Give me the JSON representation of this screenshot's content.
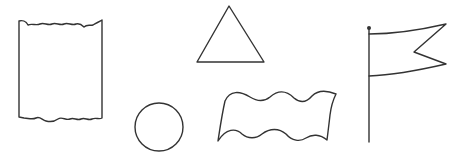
{
  "figure": {
    "title": "Shape outlines",
    "stroke_color": "#333333",
    "background": "#ffffff",
    "shapes": [
      {
        "id": "scroll-rectangle",
        "label": "Rectangle with wavy top and bottom edges"
      },
      {
        "id": "triangle",
        "label": "Triangle"
      },
      {
        "id": "circle",
        "label": "Circle"
      },
      {
        "id": "wavy-banner",
        "label": "Wavy banner"
      },
      {
        "id": "pennant-flag",
        "label": "Swallowtail flag on pole"
      }
    ]
  }
}
